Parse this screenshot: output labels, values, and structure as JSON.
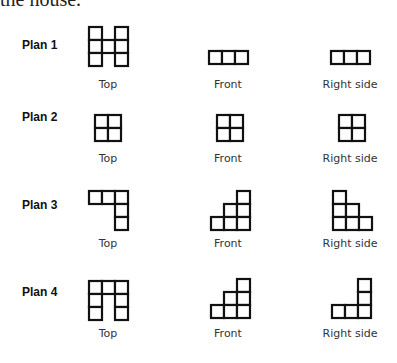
{
  "intro_text": "the house.",
  "cell_size": 13,
  "views": [
    "Top",
    "Front",
    "Right side"
  ],
  "plans": [
    {
      "label": "Plan 1",
      "top": {
        "x": 88,
        "y": 26,
        "cells": [
          [
            0,
            0
          ],
          [
            2,
            0
          ],
          [
            0,
            1
          ],
          [
            1,
            1
          ],
          [
            2,
            1
          ],
          [
            0,
            2
          ],
          [
            2,
            2
          ]
        ]
      },
      "front": {
        "x": 208,
        "y": 50,
        "cells": [
          [
            0,
            0
          ],
          [
            1,
            0
          ],
          [
            2,
            0
          ]
        ]
      },
      "right": {
        "x": 330,
        "y": 50,
        "cells": [
          [
            0,
            0
          ],
          [
            1,
            0
          ],
          [
            2,
            0
          ]
        ]
      }
    },
    {
      "label": "Plan 2",
      "top": {
        "x": 94,
        "y": 114,
        "cells": [
          [
            0,
            0
          ],
          [
            1,
            0
          ],
          [
            0,
            1
          ],
          [
            1,
            1
          ]
        ]
      },
      "front": {
        "x": 216,
        "y": 114,
        "cells": [
          [
            0,
            0
          ],
          [
            1,
            0
          ],
          [
            0,
            1
          ],
          [
            1,
            1
          ]
        ]
      },
      "right": {
        "x": 338,
        "y": 114,
        "cells": [
          [
            0,
            0
          ],
          [
            1,
            0
          ],
          [
            0,
            1
          ],
          [
            1,
            1
          ]
        ]
      }
    },
    {
      "label": "Plan 3",
      "top": {
        "x": 88,
        "y": 190,
        "cells": [
          [
            0,
            0
          ],
          [
            1,
            0
          ],
          [
            2,
            0
          ],
          [
            2,
            1
          ],
          [
            2,
            2
          ]
        ]
      },
      "front": {
        "x": 210,
        "y": 190,
        "cells": [
          [
            2,
            0
          ],
          [
            1,
            1
          ],
          [
            2,
            1
          ],
          [
            0,
            2
          ],
          [
            1,
            2
          ],
          [
            2,
            2
          ]
        ]
      },
      "right": {
        "x": 332,
        "y": 190,
        "cells": [
          [
            0,
            0
          ],
          [
            0,
            1
          ],
          [
            1,
            1
          ],
          [
            0,
            2
          ],
          [
            1,
            2
          ],
          [
            2,
            2
          ]
        ]
      }
    },
    {
      "label": "Plan 4",
      "top": {
        "x": 88,
        "y": 280,
        "cells": [
          [
            0,
            0
          ],
          [
            1,
            0
          ],
          [
            2,
            0
          ],
          [
            0,
            1
          ],
          [
            2,
            1
          ],
          [
            0,
            2
          ],
          [
            2,
            2
          ]
        ]
      },
      "front": {
        "x": 210,
        "y": 278,
        "cells": [
          [
            2,
            0
          ],
          [
            1,
            1
          ],
          [
            2,
            1
          ],
          [
            0,
            2
          ],
          [
            1,
            2
          ],
          [
            2,
            2
          ]
        ]
      },
      "right": {
        "x": 331,
        "y": 278,
        "cells": [
          [
            2,
            0
          ],
          [
            2,
            1
          ],
          [
            0,
            2
          ],
          [
            1,
            2
          ],
          [
            2,
            2
          ]
        ]
      }
    }
  ],
  "layout": {
    "plan_label_y": [
      38,
      110,
      198,
      285
    ],
    "view_label_y": [
      78,
      152,
      237,
      327
    ],
    "view_label_x": [
      63,
      183,
      305
    ]
  }
}
